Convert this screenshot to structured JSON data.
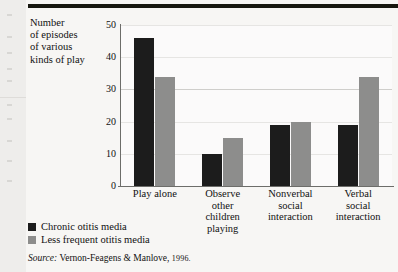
{
  "chart_data": {
    "type": "bar",
    "title": "",
    "ylabel": "Number of episodes of various kinds of play",
    "ylabel_lines": [
      "Number",
      "of episodes",
      "of various",
      "kinds of play"
    ],
    "xlabel": "",
    "categories": [
      "Play alone",
      "Observe other children playing",
      "Nonverbal social interaction",
      "Verbal social interaction"
    ],
    "category_lines": [
      [
        "Play alone"
      ],
      [
        "Observe",
        "other",
        "children",
        "playing"
      ],
      [
        "Nonverbal",
        "social",
        "interaction"
      ],
      [
        "Verbal",
        "social",
        "interaction"
      ]
    ],
    "series": [
      {
        "name": "Chronic otitis media",
        "color": "#1c1c1c",
        "values": [
          46,
          10,
          19,
          19
        ]
      },
      {
        "name": "Less frequent otitis media",
        "color": "#8d8d8c",
        "values": [
          34,
          15,
          20,
          34
        ]
      }
    ],
    "ylim": [
      0,
      50
    ],
    "yticks": [
      0,
      10,
      20,
      30,
      40,
      50
    ],
    "ytick_labels": [
      "0",
      "10",
      "20",
      "30",
      "40",
      "50"
    ],
    "grid": true,
    "grid_orientation": "horizontal",
    "legend_position": "below-left"
  },
  "legend": {
    "items": [
      {
        "label": "Chronic otitis media",
        "swatch": "dark"
      },
      {
        "label": "Less frequent otitis media",
        "swatch": "light"
      }
    ]
  },
  "source": {
    "label": "Source:",
    "citation": "Vernon-Feagens & Manlove,",
    "year": "1996."
  }
}
